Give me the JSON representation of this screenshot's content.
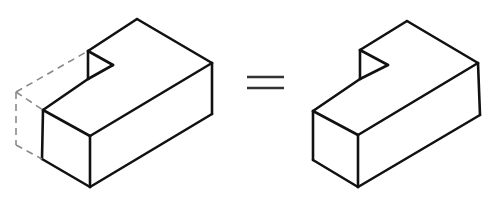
{
  "diagram": {
    "operator": "=",
    "colors": {
      "edge": "#111111",
      "hidden_edge": "#8a8a8a",
      "background": "#ffffff"
    },
    "left_figure": {
      "label": "block-with-removed-part",
      "solid_edges": [
        [
          [
            137,
            19
          ],
          [
            212,
            63
          ]
        ],
        [
          [
            137,
            19
          ],
          [
            88,
            51
          ]
        ],
        [
          [
            88,
            51
          ],
          [
            88,
            79
          ]
        ],
        [
          [
            88,
            51
          ],
          [
            113,
            65
          ]
        ],
        [
          [
            113,
            65
          ],
          [
            88,
            79
          ]
        ],
        [
          [
            88,
            79
          ],
          [
            43,
            110
          ]
        ],
        [
          [
            43,
            110
          ],
          [
            90,
            136
          ]
        ],
        [
          [
            90,
            136
          ],
          [
            212,
            63
          ]
        ],
        [
          [
            212,
            63
          ],
          [
            212,
            114
          ]
        ],
        [
          [
            43,
            110
          ],
          [
            42,
            159
          ]
        ],
        [
          [
            90,
            136
          ],
          [
            90,
            187
          ]
        ],
        [
          [
            42,
            159
          ],
          [
            90,
            187
          ]
        ],
        [
          [
            90,
            187
          ],
          [
            212,
            114
          ]
        ]
      ],
      "dashed_edges": [
        [
          [
            16,
            92
          ],
          [
            88,
            51
          ]
        ],
        [
          [
            16,
            92
          ],
          [
            43,
            110
          ]
        ],
        [
          [
            16,
            92
          ],
          [
            16,
            145
          ]
        ],
        [
          [
            16,
            145
          ],
          [
            42,
            159
          ]
        ]
      ]
    },
    "equals_sign": {
      "top_line": [
        [
          247,
          77
        ],
        [
          284,
          77
        ]
      ],
      "bottom_line": [
        [
          247,
          88
        ],
        [
          284,
          88
        ]
      ]
    },
    "right_figure": {
      "label": "resulting-block",
      "solid_edges": [
        [
          [
            407,
            21
          ],
          [
            478,
            63
          ]
        ],
        [
          [
            407,
            21
          ],
          [
            360,
            50
          ]
        ],
        [
          [
            360,
            50
          ],
          [
            360,
            79
          ]
        ],
        [
          [
            360,
            50
          ],
          [
            388,
            65
          ]
        ],
        [
          [
            388,
            65
          ],
          [
            360,
            79
          ]
        ],
        [
          [
            360,
            79
          ],
          [
            313,
            111
          ]
        ],
        [
          [
            313,
            111
          ],
          [
            358,
            135
          ]
        ],
        [
          [
            358,
            135
          ],
          [
            478,
            63
          ]
        ],
        [
          [
            478,
            63
          ],
          [
            480,
            115
          ]
        ],
        [
          [
            313,
            111
          ],
          [
            313,
            160
          ]
        ],
        [
          [
            358,
            135
          ],
          [
            358,
            187
          ]
        ],
        [
          [
            313,
            160
          ],
          [
            358,
            187
          ]
        ],
        [
          [
            358,
            187
          ],
          [
            480,
            115
          ]
        ]
      ]
    }
  }
}
